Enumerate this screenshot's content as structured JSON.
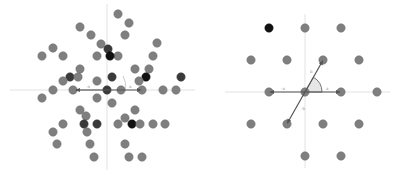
{
  "colors": {
    "point": "#7f7f7f",
    "point_stroke": "#6c6c6c",
    "point_dark": "#3a3a3a",
    "point_black": "#111111",
    "axis": "#e2e2e2",
    "vector": "#555555",
    "angle_fill": "#e6e6e6"
  },
  "left_panel": {
    "origin": [
      107,
      90
    ],
    "labels": {
      "vec_a": "-a",
      "vec_b": "a"
    },
    "points": [
      [
        118,
        14,
        "g"
      ],
      [
        129,
        23,
        "g"
      ],
      [
        80,
        27,
        "g"
      ],
      [
        91,
        35,
        "g"
      ],
      [
        125,
        35,
        "g"
      ],
      [
        101,
        44,
        "g"
      ],
      [
        157,
        43,
        "g"
      ],
      [
        53,
        48,
        "g"
      ],
      [
        108,
        49,
        "d"
      ],
      [
        42,
        56,
        "g"
      ],
      [
        63,
        56,
        "g"
      ],
      [
        97,
        56,
        "g"
      ],
      [
        118,
        56,
        "g"
      ],
      [
        153,
        56,
        "g"
      ],
      [
        110,
        56,
        "b"
      ],
      [
        80,
        69,
        "g"
      ],
      [
        135,
        69,
        "g"
      ],
      [
        149,
        69,
        "g"
      ],
      [
        70,
        77,
        "d"
      ],
      [
        78,
        77,
        "g"
      ],
      [
        112,
        77,
        "d"
      ],
      [
        146,
        77,
        "b"
      ],
      [
        181,
        77,
        "d"
      ],
      [
        63,
        81,
        "g"
      ],
      [
        97,
        81,
        "g"
      ],
      [
        139,
        81,
        "g"
      ],
      [
        53,
        90,
        "g"
      ],
      [
        73,
        90,
        "g"
      ],
      [
        107,
        90,
        "d"
      ],
      [
        121,
        90,
        "g"
      ],
      [
        142,
        90,
        "g"
      ],
      [
        163,
        90,
        "g"
      ],
      [
        176,
        90,
        "g"
      ],
      [
        42,
        98,
        "g"
      ],
      [
        97,
        98,
        "g"
      ],
      [
        112,
        103,
        "g"
      ],
      [
        80,
        110,
        "g"
      ],
      [
        135,
        110,
        "g"
      ],
      [
        86,
        116,
        "g"
      ],
      [
        125,
        118,
        "g"
      ],
      [
        63,
        124,
        "g"
      ],
      [
        84,
        124,
        "d"
      ],
      [
        97,
        124,
        "d"
      ],
      [
        118,
        124,
        "g"
      ],
      [
        132,
        124,
        "b"
      ],
      [
        140,
        124,
        "g"
      ],
      [
        153,
        124,
        "g"
      ],
      [
        165,
        124,
        "g"
      ],
      [
        53,
        132,
        "g"
      ],
      [
        87,
        132,
        "g"
      ],
      [
        57,
        144,
        "g"
      ],
      [
        90,
        144,
        "g"
      ],
      [
        125,
        144,
        "g"
      ],
      [
        94,
        157,
        "g"
      ],
      [
        129,
        157,
        "g"
      ],
      [
        142,
        157,
        "g"
      ]
    ]
  },
  "right_panel": {
    "origin": [
      305,
      92
    ],
    "labels": {
      "a": "a",
      "neg_a": "-a",
      "b": "b",
      "neg_b": "-b"
    },
    "points": [
      [
        269,
        28,
        "b"
      ],
      [
        305,
        28,
        "g"
      ],
      [
        341,
        28,
        "g"
      ],
      [
        251,
        60,
        "g"
      ],
      [
        287,
        60,
        "g"
      ],
      [
        323,
        60,
        "g"
      ],
      [
        359,
        60,
        "g"
      ],
      [
        269,
        92,
        "g"
      ],
      [
        305,
        92,
        "g"
      ],
      [
        341,
        92,
        "g"
      ],
      [
        377,
        92,
        "g"
      ],
      [
        251,
        124,
        "g"
      ],
      [
        287,
        124,
        "g"
      ],
      [
        323,
        124,
        "g"
      ],
      [
        359,
        124,
        "g"
      ],
      [
        305,
        156,
        "g"
      ],
      [
        341,
        156,
        "g"
      ]
    ]
  }
}
